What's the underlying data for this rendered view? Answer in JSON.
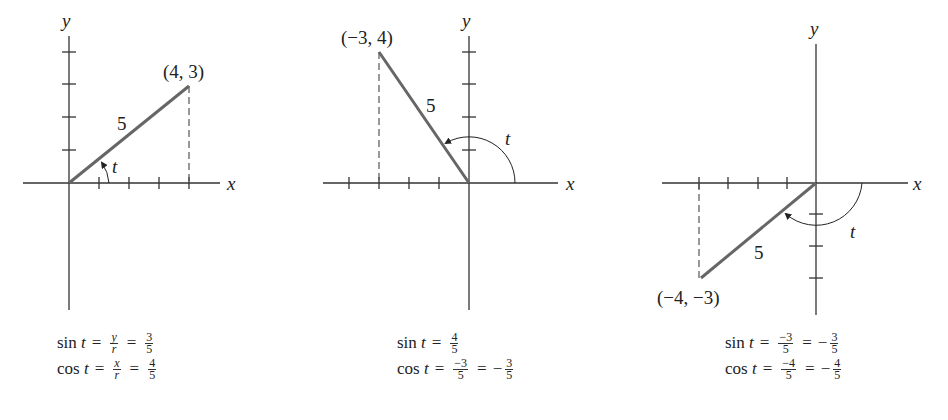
{
  "diagrams": [
    {
      "point_label": "(4, 3)",
      "radius_label": "5",
      "angle_label": "t",
      "x_axis_label": "x",
      "y_axis_label": "y",
      "sin": {
        "func": "sin",
        "var": "t",
        "steps": [
          {
            "num": "y",
            "den": "r",
            "italic": true
          },
          {
            "num": "3",
            "den": "5"
          }
        ]
      },
      "cos": {
        "func": "cos",
        "var": "t",
        "steps": [
          {
            "num": "x",
            "den": "r",
            "italic": true
          },
          {
            "num": "4",
            "den": "5"
          }
        ]
      }
    },
    {
      "point_label": "(−3, 4)",
      "radius_label": "5",
      "angle_label": "t",
      "x_axis_label": "x",
      "y_axis_label": "y",
      "sin": {
        "func": "sin",
        "var": "t",
        "steps": [
          {
            "num": "4",
            "den": "5"
          }
        ]
      },
      "cos": {
        "func": "cos",
        "var": "t",
        "steps": [
          {
            "num": "−3",
            "den": "5"
          },
          {
            "sign": "−",
            "num": "3",
            "den": "5"
          }
        ]
      }
    },
    {
      "point_label": "(−4, −3)",
      "radius_label": "5",
      "angle_label": "t",
      "x_axis_label": "x",
      "y_axis_label": "y",
      "sin": {
        "func": "sin",
        "var": "t",
        "steps": [
          {
            "num": "−3",
            "den": "5"
          },
          {
            "sign": "−",
            "num": "3",
            "den": "5"
          }
        ]
      },
      "cos": {
        "func": "cos",
        "var": "t",
        "steps": [
          {
            "num": "−4",
            "den": "5"
          },
          {
            "sign": "−",
            "num": "4",
            "den": "5"
          }
        ]
      }
    }
  ],
  "colors": {
    "axis": "#333333",
    "radius": "#666666",
    "text": "#222222"
  }
}
